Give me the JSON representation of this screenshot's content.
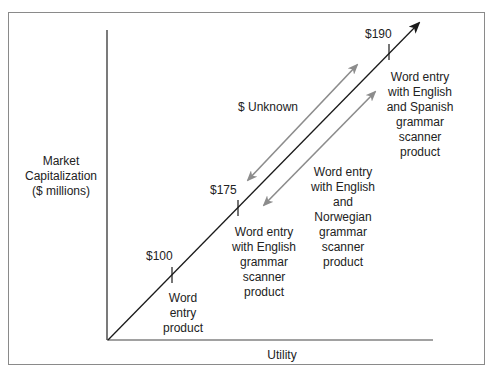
{
  "diagram": {
    "type": "value-vs-utility line diagram",
    "y_axis_label": "Market\nCapitalization\n($ millions)",
    "x_axis_label": "Utility",
    "points": [
      {
        "price": "$100",
        "description": "Word\nentry\nproduct"
      },
      {
        "price": "$175",
        "description": "Word entry\nwith English\ngrammar\nscanner\nproduct"
      },
      {
        "price": "$190",
        "description": "Word entry\nwith English\nand Spanish\ngrammar\nscanner\nproduct"
      }
    ],
    "unknown_label": "$ Unknown",
    "intermediate_product": "Word entry\nwith English\nand\nNorwegian\ngrammar\nscanner\nproduct",
    "colors": {
      "main_line": "#1a1a1a",
      "comparison_arrows": "#8c8c8c",
      "frame": "#8a8a8a"
    }
  }
}
